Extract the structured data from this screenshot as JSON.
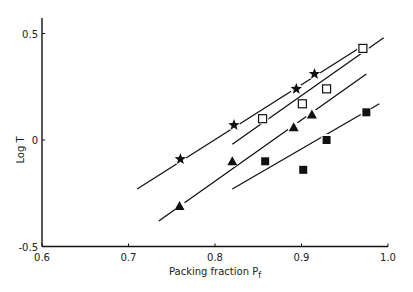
{
  "chart_data": {
    "type": "scatter",
    "title": "",
    "xlabel": "Packing fraction P_f",
    "ylabel": "Log T",
    "xlim": [
      0.6,
      1.0
    ],
    "ylim": [
      -0.5,
      0.55
    ],
    "xticks": [
      "0.6",
      "0.7",
      "0.8",
      "0.9",
      "1.0"
    ],
    "yticks": [
      "0.5",
      "0",
      "-0.5"
    ],
    "grid": false,
    "legend": null,
    "series": [
      {
        "name": "star",
        "marker": "star",
        "x": [
          0.76,
          0.822,
          0.894,
          0.915
        ],
        "y": [
          -0.09,
          0.07,
          0.24,
          0.31
        ],
        "fit": {
          "x": [
            0.71,
            0.97
          ],
          "y": [
            -0.23,
            0.44
          ]
        }
      },
      {
        "name": "open square",
        "marker": "open-square",
        "x": [
          0.855,
          0.901,
          0.929,
          0.971
        ],
        "y": [
          0.1,
          0.17,
          0.24,
          0.43
        ],
        "fit": {
          "x": [
            0.82,
            0.995
          ],
          "y": [
            -0.02,
            0.48
          ]
        }
      },
      {
        "name": "triangle",
        "marker": "triangle",
        "x": [
          0.759,
          0.82,
          0.891,
          0.912
        ],
        "y": [
          -0.31,
          -0.1,
          0.06,
          0.12
        ],
        "fit": {
          "x": [
            0.735,
            0.975
          ],
          "y": [
            -0.38,
            0.31
          ]
        }
      },
      {
        "name": "filled square",
        "marker": "filled-square",
        "x": [
          0.858,
          0.902,
          0.929,
          0.975
        ],
        "y": [
          -0.1,
          -0.14,
          0.0,
          0.13
        ],
        "fit": {
          "x": [
            0.82,
            0.99
          ],
          "y": [
            -0.23,
            0.17
          ]
        }
      }
    ]
  },
  "axes": {
    "xlabel_main": "Packing fraction P",
    "xlabel_sub": "f",
    "ylabel": "Log T"
  }
}
